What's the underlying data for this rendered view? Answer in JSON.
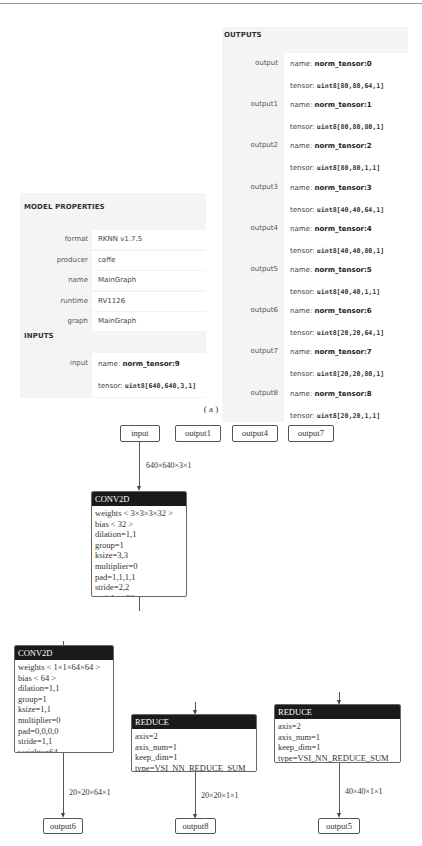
{
  "caption": "( a )",
  "model_properties": {
    "title": "MODEL PROPERTIES",
    "rows": [
      {
        "key": "format",
        "value": "RKNN v1.7.5"
      },
      {
        "key": "producer",
        "value": "caffe"
      },
      {
        "key": "name",
        "value": "MainGraph"
      },
      {
        "key": "runtime",
        "value": "RV1126"
      },
      {
        "key": "graph",
        "value": "MainGraph"
      }
    ]
  },
  "inputs": {
    "title": "INPUTS",
    "rows": [
      {
        "key": "input",
        "name_label": "name:",
        "name": "norm_tensor:9",
        "tensor_label": "tensor:",
        "tensor": "uint8[640,640,3,1]"
      }
    ]
  },
  "outputs": {
    "title": "OUTPUTS",
    "rows": [
      {
        "key": "output",
        "name_label": "name:",
        "name": "norm_tensor:0",
        "tensor_label": "tensor:",
        "tensor": "uint8[80,80,64,1]"
      },
      {
        "key": "output1",
        "name_label": "name:",
        "name": "norm_tensor:1",
        "tensor_label": "tensor:",
        "tensor": "uint8[80,80,80,1]"
      },
      {
        "key": "output2",
        "name_label": "name:",
        "name": "norm_tensor:2",
        "tensor_label": "tensor:",
        "tensor": "uint8[80,80,1,1]"
      },
      {
        "key": "output3",
        "name_label": "name:",
        "name": "norm_tensor:3",
        "tensor_label": "tensor:",
        "tensor": "uint8[40,40,64,1]"
      },
      {
        "key": "output4",
        "name_label": "name:",
        "name": "norm_tensor:4",
        "tensor_label": "tensor:",
        "tensor": "uint8[40,40,80,1]"
      },
      {
        "key": "output5",
        "name_label": "name:",
        "name": "norm_tensor:5",
        "tensor_label": "tensor:",
        "tensor": "uint8[40,40,1,1]"
      },
      {
        "key": "output6",
        "name_label": "name:",
        "name": "norm_tensor:6",
        "tensor_label": "tensor:",
        "tensor": "uint8[20,20,64,1]"
      },
      {
        "key": "output7",
        "name_label": "name:",
        "name": "norm_tensor:7",
        "tensor_label": "tensor:",
        "tensor": "uint8[20,20,80,1]"
      },
      {
        "key": "output8",
        "name_label": "name:",
        "name": "norm_tensor:8",
        "tensor_label": "tensor:",
        "tensor": "uint8[20,20,1,1]"
      }
    ]
  },
  "graph": {
    "top_nodes": [
      "input",
      "output1",
      "output4",
      "output7"
    ],
    "edge_input": "640×640×3×1",
    "conv1": {
      "op": "CONV2D",
      "attrs": [
        "weights < 3×3×3×32 >",
        "bias < 32 >",
        "dilation=1,1",
        "group=1",
        "ksize=3,3",
        "multiplier=0",
        "pad=1,1,1,1",
        "stride=2,2",
        "weights=32"
      ]
    },
    "conv2": {
      "op": "CONV2D",
      "attrs": [
        "weights < 1×1×64×64 >",
        "bias < 64 >",
        "dilation=1,1",
        "group=1",
        "ksize=1,1",
        "multiplier=0",
        "pad=0,0,0,0",
        "stride=1,1",
        "weights=64"
      ],
      "edge": "20×20×64×1",
      "output": "output6"
    },
    "reduce1": {
      "op": "REDUCE",
      "attrs": [
        "axis=2",
        "axis_num=1",
        "keep_dim=1",
        "type=VSI_NN_REDUCE_SUM"
      ],
      "edge": "20×20×1×1",
      "output": "output8"
    },
    "reduce2": {
      "op": "REDUCE",
      "attrs": [
        "axis=2",
        "axis_num=1",
        "keep_dim=1",
        "type=VSI_NN_REDUCE_SUM"
      ],
      "edge": "40×40×1×1",
      "output": "output5"
    }
  }
}
